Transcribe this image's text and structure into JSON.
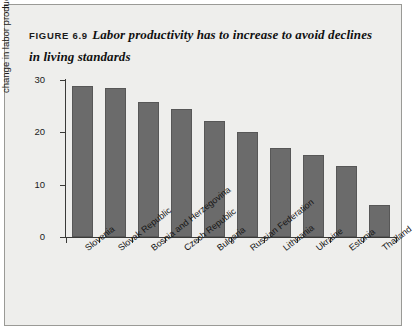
{
  "figure": {
    "label": "FIGURE 6.9",
    "title": "Labor productivity has to increase to avoid declines in living standards"
  },
  "colors": {
    "bar_fill": "#6b6b6b",
    "bar_stroke": "#575757",
    "axis": "#3a3a38",
    "panel_background": "#eeeeec",
    "frame_border": "#9a9a96",
    "text": "#1b1b1b"
  },
  "chart_data": {
    "type": "bar",
    "title": "Labor productivity has to increase to avoid declines in living standards",
    "xlabel": "",
    "ylabel": "change in labor productivity, %",
    "ylim": [
      0,
      30
    ],
    "yticks": [
      0,
      10,
      20,
      30
    ],
    "ytick_labels": [
      "0",
      "10",
      "20",
      "30"
    ],
    "grid": false,
    "legend": false,
    "categories": [
      "Slovenia",
      "Slovak Republic",
      "Bosnia and Herzegovina",
      "Czech Republic",
      "Bulgaria",
      "Russian Federation",
      "Lithuania",
      "Ukraine",
      "Estonia",
      "Thailand"
    ],
    "values": [
      28.8,
      28.4,
      25.8,
      24.4,
      22.2,
      20.0,
      17.0,
      15.7,
      13.5,
      6.1
    ]
  }
}
